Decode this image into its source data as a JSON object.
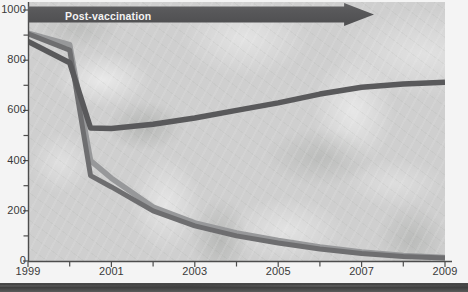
{
  "chart_data": {
    "type": "line",
    "title": "",
    "subtitle": "",
    "xlabel": "",
    "ylabel": "",
    "xlim": [
      1999,
      2009
    ],
    "ylim": [
      0,
      1000
    ],
    "grid": false,
    "legend_position": "none",
    "x_tick_labels": [
      "1999",
      "2001",
      "2003",
      "2005",
      "2007",
      "2009"
    ],
    "x_tick_values": [
      1999,
      2001,
      2003,
      2005,
      2007,
      2009
    ],
    "x_minor_tick_values": [
      2000,
      2002,
      2004,
      2006,
      2008
    ],
    "y_tick_labels": [
      "0",
      "200",
      "400",
      "600",
      "800",
      "1000"
    ],
    "y_tick_values": [
      0,
      200,
      400,
      600,
      800,
      1000
    ],
    "y_minor_tick_values": [
      100,
      300,
      500,
      700,
      900
    ],
    "x": [
      1999,
      2000,
      2000.5,
      2001,
      2002,
      2003,
      2004,
      2005,
      2006,
      2007,
      2008,
      2009
    ],
    "series": [
      {
        "name": "series-dark",
        "color": "#59595b",
        "values": [
          875,
          790,
          530,
          528,
          545,
          570,
          600,
          630,
          665,
          692,
          705,
          712
        ]
      },
      {
        "name": "series-mid-gray",
        "color": "#6e6e70",
        "values": [
          905,
          840,
          340,
          295,
          200,
          140,
          100,
          72,
          48,
          30,
          18,
          12
        ]
      },
      {
        "name": "series-light-gray",
        "color": "#97989a",
        "values": [
          908,
          862,
          400,
          330,
          215,
          152,
          112,
          82,
          56,
          36,
          22,
          14
        ]
      }
    ],
    "annotations": [
      {
        "name": "post-vaccination-arrow",
        "label": "Post-vaccination",
        "start_x": 1999,
        "end_x": 2007.3,
        "y": 1000,
        "color": "#58585a",
        "text_color": "#f2f2f2"
      }
    ]
  },
  "axis": {
    "y_labels": [
      "1000",
      "800",
      "600",
      "400",
      "200",
      "0"
    ],
    "x_labels": [
      "1999",
      "2001",
      "2003",
      "2005",
      "2007",
      "2009"
    ]
  },
  "colors": {
    "plot_background": "#cfcfcf",
    "page_background": "#f4f4f4",
    "axis": "#4d4d4d",
    "tick_text": "#3a3a3a",
    "banner": "#58585a",
    "banner_text": "#f2f2f2",
    "bottom_strip": "#3c3c3c"
  }
}
